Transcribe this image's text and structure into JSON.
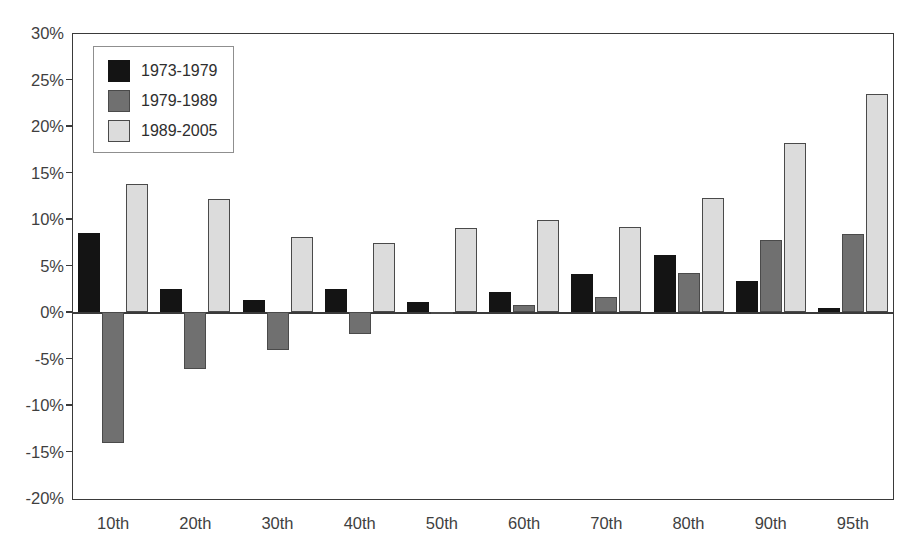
{
  "chart_data": {
    "type": "bar",
    "title": "",
    "xlabel": "",
    "ylabel": "",
    "categories": [
      "10th",
      "20th",
      "30th",
      "40th",
      "50th",
      "60th",
      "70th",
      "80th",
      "90th",
      "95th"
    ],
    "series": [
      {
        "name": "1973-1979",
        "color": "#141414",
        "values": [
          8.5,
          2.5,
          1.3,
          2.5,
          1.1,
          2.2,
          4.1,
          6.1,
          3.3,
          0.4
        ]
      },
      {
        "name": "1979-1989",
        "color": "#707070",
        "values": [
          -14.1,
          -6.1,
          -4.1,
          -2.4,
          -0.1,
          0.7,
          1.6,
          4.2,
          7.7,
          8.4
        ]
      },
      {
        "name": "1989-2005",
        "color": "#dcdcdc",
        "values": [
          13.8,
          12.2,
          8.1,
          7.4,
          9.0,
          9.9,
          9.1,
          12.3,
          18.2,
          23.4
        ]
      }
    ],
    "ylim": [
      -20,
      30
    ],
    "ytick_step": 5,
    "ytick_labels": [
      "30%",
      "25%",
      "20%",
      "15%",
      "10%",
      "5%",
      "0%",
      "-5%",
      "-10%",
      "-15%",
      "-20%"
    ],
    "ytick_values": [
      30,
      25,
      20,
      15,
      10,
      5,
      0,
      -5,
      -10,
      -15,
      -20
    ],
    "grid": false,
    "legend_position": "top-left",
    "value_suffix": "%"
  }
}
